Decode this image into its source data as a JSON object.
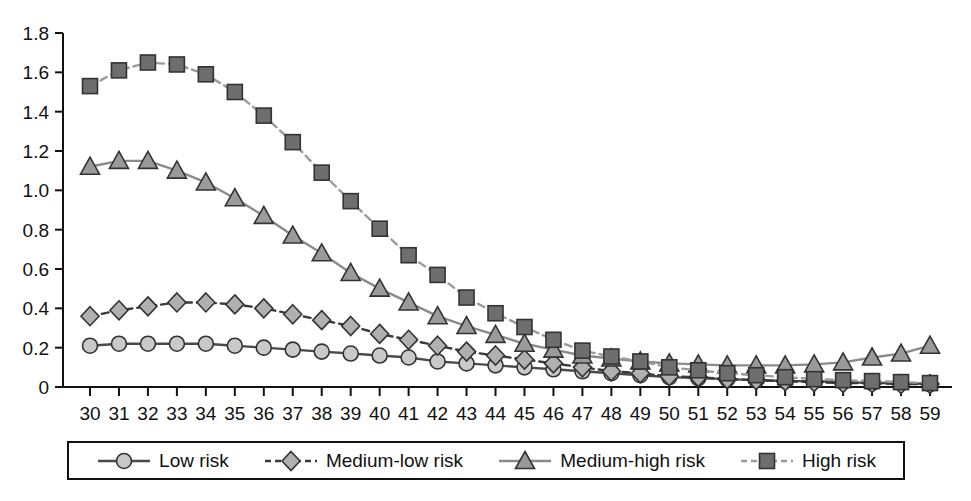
{
  "chart_data": {
    "type": "line",
    "title": "",
    "xlabel": "",
    "ylabel": "",
    "xlim": [
      30,
      59
    ],
    "ylim": [
      0,
      1.8
    ],
    "grid": false,
    "legend_position": "bottom",
    "x": [
      30,
      31,
      32,
      33,
      34,
      35,
      36,
      37,
      38,
      39,
      40,
      41,
      42,
      43,
      44,
      45,
      46,
      47,
      48,
      49,
      50,
      51,
      52,
      53,
      54,
      55,
      56,
      57,
      58,
      59
    ],
    "xtick_labels": [
      "30",
      "31",
      "32",
      "33",
      "34",
      "35",
      "36",
      "37",
      "38",
      "39",
      "40",
      "41",
      "42",
      "43",
      "44",
      "45",
      "46",
      "47",
      "48",
      "49",
      "50",
      "51",
      "52",
      "53",
      "54",
      "55",
      "56",
      "57",
      "58",
      "59"
    ],
    "ytick_labels": [
      "0",
      "0.2",
      "0.4",
      "0.6",
      "0.8",
      "1.0",
      "1.2",
      "1.4",
      "1.6",
      "1.8"
    ],
    "ytick_values": [
      0,
      0.2,
      0.4,
      0.6,
      0.8,
      1.0,
      1.2,
      1.4,
      1.6,
      1.8
    ],
    "series": [
      {
        "name": "Low risk",
        "marker": "circle",
        "line_style": "solid",
        "color": "#4a4a4a",
        "marker_fill": "#c9c9c9",
        "values": [
          0.21,
          0.22,
          0.22,
          0.22,
          0.22,
          0.21,
          0.2,
          0.19,
          0.18,
          0.17,
          0.16,
          0.15,
          0.13,
          0.12,
          0.11,
          0.1,
          0.09,
          0.08,
          0.07,
          0.06,
          0.05,
          0.045,
          0.04,
          0.035,
          0.03,
          0.03,
          0.025,
          0.02,
          0.02,
          0.015
        ]
      },
      {
        "name": "Medium-low risk",
        "marker": "diamond",
        "line_style": "dashed",
        "color": "#3a3a3a",
        "marker_fill": "#b0b0b0",
        "values": [
          0.36,
          0.39,
          0.41,
          0.43,
          0.43,
          0.42,
          0.4,
          0.37,
          0.34,
          0.31,
          0.27,
          0.24,
          0.21,
          0.18,
          0.16,
          0.14,
          0.12,
          0.1,
          0.08,
          0.07,
          0.055,
          0.05,
          0.04,
          0.035,
          0.03,
          0.025,
          0.02,
          0.02,
          0.015,
          0.015
        ]
      },
      {
        "name": "Medium-high risk",
        "marker": "triangle",
        "line_style": "solid",
        "color": "#8a8a8a",
        "marker_fill": "#9a9a9a",
        "values": [
          1.12,
          1.15,
          1.15,
          1.1,
          1.04,
          0.96,
          0.87,
          0.77,
          0.68,
          0.58,
          0.5,
          0.43,
          0.36,
          0.31,
          0.265,
          0.22,
          0.19,
          0.16,
          0.145,
          0.13,
          0.12,
          0.115,
          0.11,
          0.11,
          0.11,
          0.115,
          0.125,
          0.15,
          0.17,
          0.21
        ]
      },
      {
        "name": "High risk",
        "marker": "square",
        "line_style": "dashed",
        "color": "#9a9a9a",
        "marker_fill": "#6e6e6e",
        "values": [
          1.53,
          1.61,
          1.65,
          1.64,
          1.59,
          1.5,
          1.38,
          1.245,
          1.09,
          0.945,
          0.805,
          0.67,
          0.57,
          0.455,
          0.375,
          0.305,
          0.24,
          0.185,
          0.155,
          0.13,
          0.1,
          0.085,
          0.07,
          0.06,
          0.05,
          0.04,
          0.035,
          0.03,
          0.025,
          0.02
        ]
      }
    ]
  },
  "legend": {
    "items": [
      {
        "label": "Low risk",
        "marker": "circle-marker",
        "line_style": "solid"
      },
      {
        "label": "Medium-low risk",
        "marker": "diamond-marker",
        "line_style": "dashed"
      },
      {
        "label": "Medium-high risk",
        "marker": "triangle-marker",
        "line_style": "solid"
      },
      {
        "label": "High risk",
        "marker": "square-marker",
        "line_style": "dashed"
      }
    ]
  },
  "axes": {
    "axis_color": "#111111"
  }
}
